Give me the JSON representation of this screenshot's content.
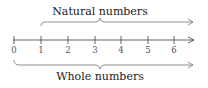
{
  "diagram": {
    "type": "number-line",
    "top_label": "Natural numbers",
    "bottom_label": "Whole numbers",
    "ticks": [
      "0",
      "1",
      "2",
      "3",
      "4",
      "5",
      "6"
    ],
    "top_brace_starts_at": "1",
    "bottom_brace_starts_at": "0",
    "colors": {
      "axis": "#555555",
      "brace": "#777777",
      "text": "#222222"
    }
  }
}
